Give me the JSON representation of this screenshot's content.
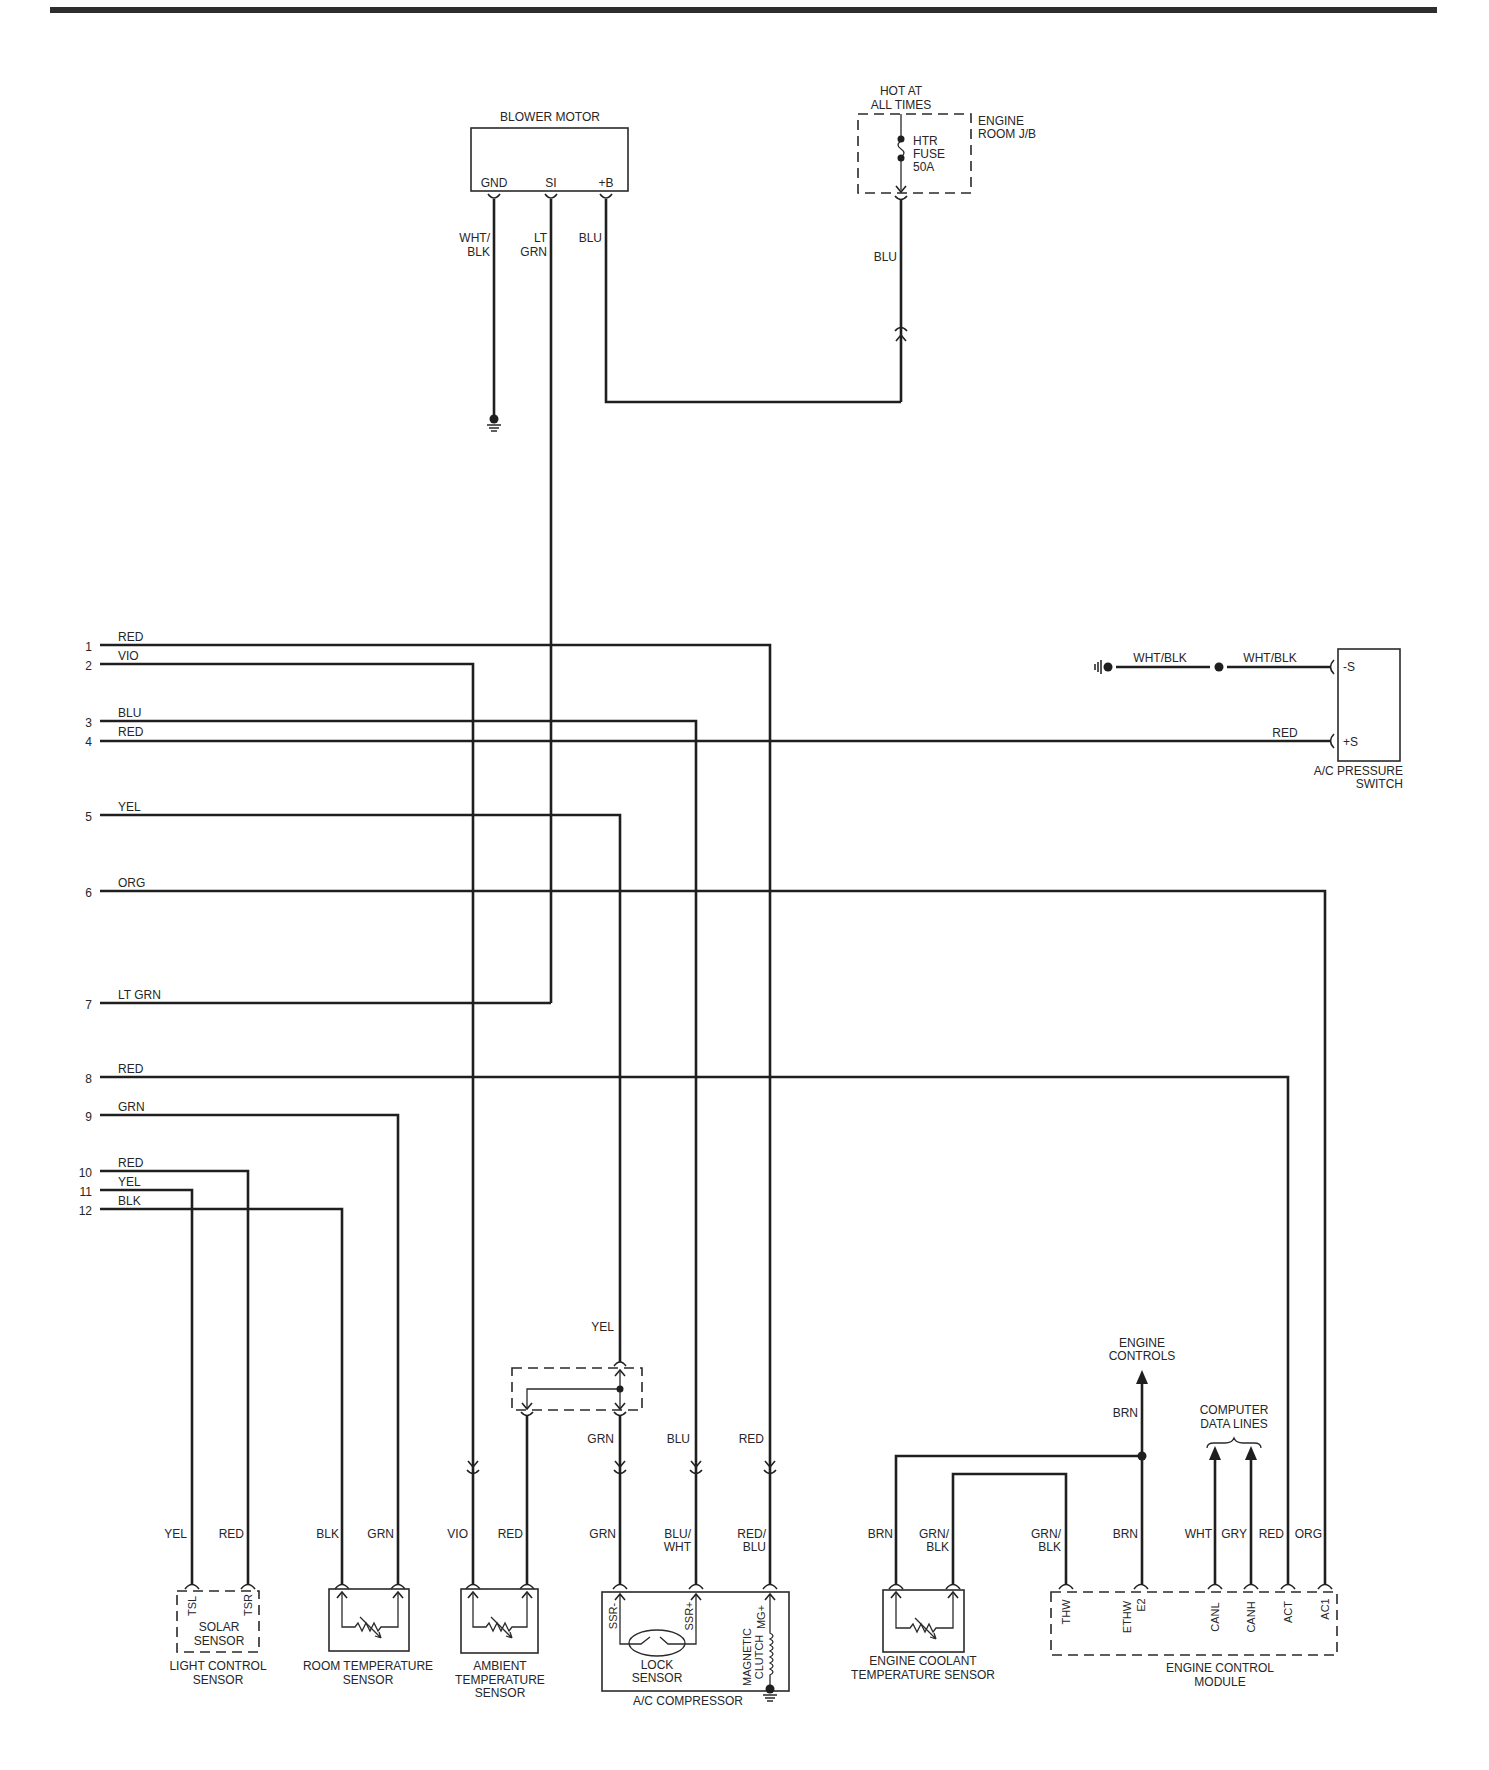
{
  "blower_motor": {
    "name": "BLOWER MOTOR",
    "pins": [
      "GND",
      "SI",
      "+B"
    ],
    "wire_gnd": [
      "WHT/",
      "BLK"
    ],
    "wire_si": [
      "LT",
      "GRN"
    ],
    "wire_b": "BLU"
  },
  "engine_room_jb": {
    "supply": [
      "HOT AT",
      "ALL TIMES"
    ],
    "name": [
      "ENGINE",
      "ROOM J/B"
    ],
    "fuse": [
      "HTR",
      "FUSE",
      "50A"
    ],
    "wire": "BLU"
  },
  "harness_rows": [
    {
      "pin": "1",
      "wire": "RED"
    },
    {
      "pin": "2",
      "wire": "VIO"
    },
    {
      "pin": "3",
      "wire": "BLU"
    },
    {
      "pin": "4",
      "wire": "RED"
    },
    {
      "pin": "5",
      "wire": "YEL"
    },
    {
      "pin": "6",
      "wire": "ORG"
    },
    {
      "pin": "7",
      "wire": "LT GRN"
    },
    {
      "pin": "8",
      "wire": "RED"
    },
    {
      "pin": "9",
      "wire": "GRN"
    },
    {
      "pin": "10",
      "wire": "RED"
    },
    {
      "pin": "11",
      "wire": "YEL"
    },
    {
      "pin": "12",
      "wire": "BLK"
    }
  ],
  "ac_pressure_switch": {
    "name": [
      "A/C PRESSURE",
      "SWITCH"
    ],
    "pins": [
      "-S",
      "+S"
    ],
    "wire_ground_a": "WHT/BLK",
    "wire_ground_b": "WHT/BLK",
    "wire_pos": "RED"
  },
  "junction": {
    "wire_in": "YEL",
    "wire_out": "GRN"
  },
  "mid_wire_labels": {
    "blu": "BLU",
    "red": "RED"
  },
  "light_control_sensor": {
    "name": [
      "LIGHT CONTROL",
      "SENSOR"
    ],
    "inner": [
      "SOLAR",
      "SENSOR"
    ],
    "pins": [
      "TSL",
      "TSR"
    ],
    "wires": [
      "YEL",
      "RED"
    ]
  },
  "room_temperature_sensor": {
    "name": [
      "ROOM TEMPERATURE",
      "SENSOR"
    ],
    "wires": [
      "BLK",
      "GRN"
    ]
  },
  "ambient_temperature_sensor": {
    "name": [
      "AMBIENT",
      "TEMPERATURE",
      "SENSOR"
    ],
    "wires": [
      "VIO",
      "RED"
    ]
  },
  "ac_compressor": {
    "name": "A/C COMPRESSOR",
    "pins": [
      "SSR-",
      "SSR+",
      "MG+"
    ],
    "lock_sensor": [
      "LOCK",
      "SENSOR"
    ],
    "clutch": [
      "MAGNETIC",
      "CLUTCH"
    ],
    "wires": [
      [
        "GRN"
      ],
      [
        "BLU/",
        "WHT"
      ],
      [
        "RED/",
        "BLU"
      ]
    ]
  },
  "engine_coolant_temperature_sensor": {
    "name": [
      "ENGINE COOLANT",
      "TEMPERATURE SENSOR"
    ],
    "wires": [
      [
        "BRN"
      ],
      [
        "GRN/",
        "BLK"
      ]
    ]
  },
  "engine_controls": {
    "label": [
      "ENGINE",
      "CONTROLS"
    ],
    "wire": "BRN"
  },
  "computer_data_lines": {
    "label": [
      "COMPUTER",
      "DATA LINES"
    ]
  },
  "engine_control_module": {
    "name": [
      "ENGINE CONTROL",
      "MODULE"
    ],
    "pins": [
      "THW",
      "ETHW",
      "E2",
      "CANL",
      "CANH",
      "ACT",
      "AC1"
    ],
    "wires": [
      [
        "GRN/",
        "BLK"
      ],
      [
        "BRN"
      ],
      [
        "WHT"
      ],
      [
        "GRY"
      ],
      [
        "RED"
      ],
      [
        "ORG"
      ]
    ]
  }
}
